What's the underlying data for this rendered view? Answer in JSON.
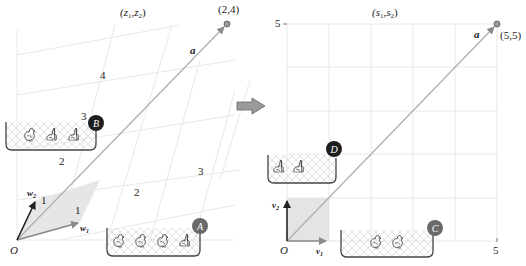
{
  "left_panel": {
    "title": "(z",
    "title_sub1": "1",
    "title_mid": ",z",
    "title_sub2": "2",
    "title_end": ")",
    "origin_label": "O",
    "point_label": "(2,4)",
    "vector_a_label": "a",
    "w1_label": "w",
    "w1_sub": "1",
    "w2_label": "w",
    "w2_sub": "2",
    "grid_labels": [
      "1",
      "1",
      "2",
      "2",
      "3",
      "3",
      "4"
    ],
    "basket_B": {
      "badge": "B",
      "animals": [
        "chicken",
        "rabbit",
        "rabbit"
      ]
    },
    "basket_A": {
      "badge": "A",
      "animals": [
        "chicken",
        "chicken",
        "chicken",
        "rabbit"
      ]
    }
  },
  "right_panel": {
    "title": "(s",
    "title_sub1": "1",
    "title_mid": ",s",
    "title_sub2": "2",
    "title_end": ")",
    "origin_label": "O",
    "point_label": "(5,5)",
    "vector_a_label": "a",
    "v1_label": "v",
    "v1_sub": "1",
    "v2_label": "v",
    "v2_sub": "2",
    "y_tick": "5",
    "x_tick": "5",
    "basket_D": {
      "badge": "D",
      "animals": [
        "rabbit",
        "rabbit"
      ]
    },
    "basket_C": {
      "badge": "C",
      "animals": [
        "chicken",
        "chicken"
      ]
    }
  },
  "transform_arrow": "right-arrow",
  "colors": {
    "grid": "#e6e6e6",
    "skew_grid": "#e8e8e8",
    "vector": "#9a9a9a",
    "dark_badge": "#1e1e1e",
    "gray_badge": "#6a6a6a",
    "unit_fill": "#e4e4e4",
    "basket_stroke": "#444444"
  }
}
